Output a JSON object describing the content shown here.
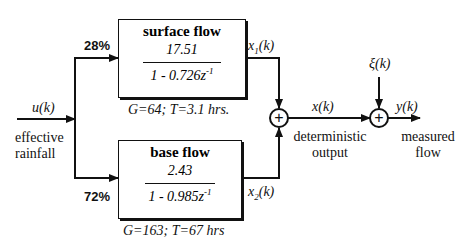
{
  "input": {
    "signal": "u(k)",
    "label_line1": "effective",
    "label_line2": "rainfall"
  },
  "branches": {
    "top_percent": "28%",
    "bottom_percent": "72%"
  },
  "surface_flow": {
    "title": "surface flow",
    "numerator": "17.51",
    "denominator_prefix": "1 - 0.726z",
    "denominator_exp": "-1",
    "params": "G=64; T=3.1 hrs.",
    "output_signal_base": "x",
    "output_signal_sub": "1",
    "output_signal_suffix": "(k)"
  },
  "base_flow": {
    "title": "base flow",
    "numerator": "2.43",
    "denominator_prefix": "1 - 0.985z",
    "denominator_exp": "-1",
    "params": "G=163; T=67 hrs",
    "output_signal_base": "x",
    "output_signal_sub": "2",
    "output_signal_suffix": "(k)"
  },
  "junction1": {
    "symbol": "+",
    "output_signal": "x(k)",
    "label_line1": "deterministic",
    "label_line2": "output"
  },
  "junction2": {
    "symbol": "+",
    "noise_signal": "ξ(k)",
    "output_signal": "y(k)",
    "label_line1": "measured",
    "label_line2": "flow"
  }
}
